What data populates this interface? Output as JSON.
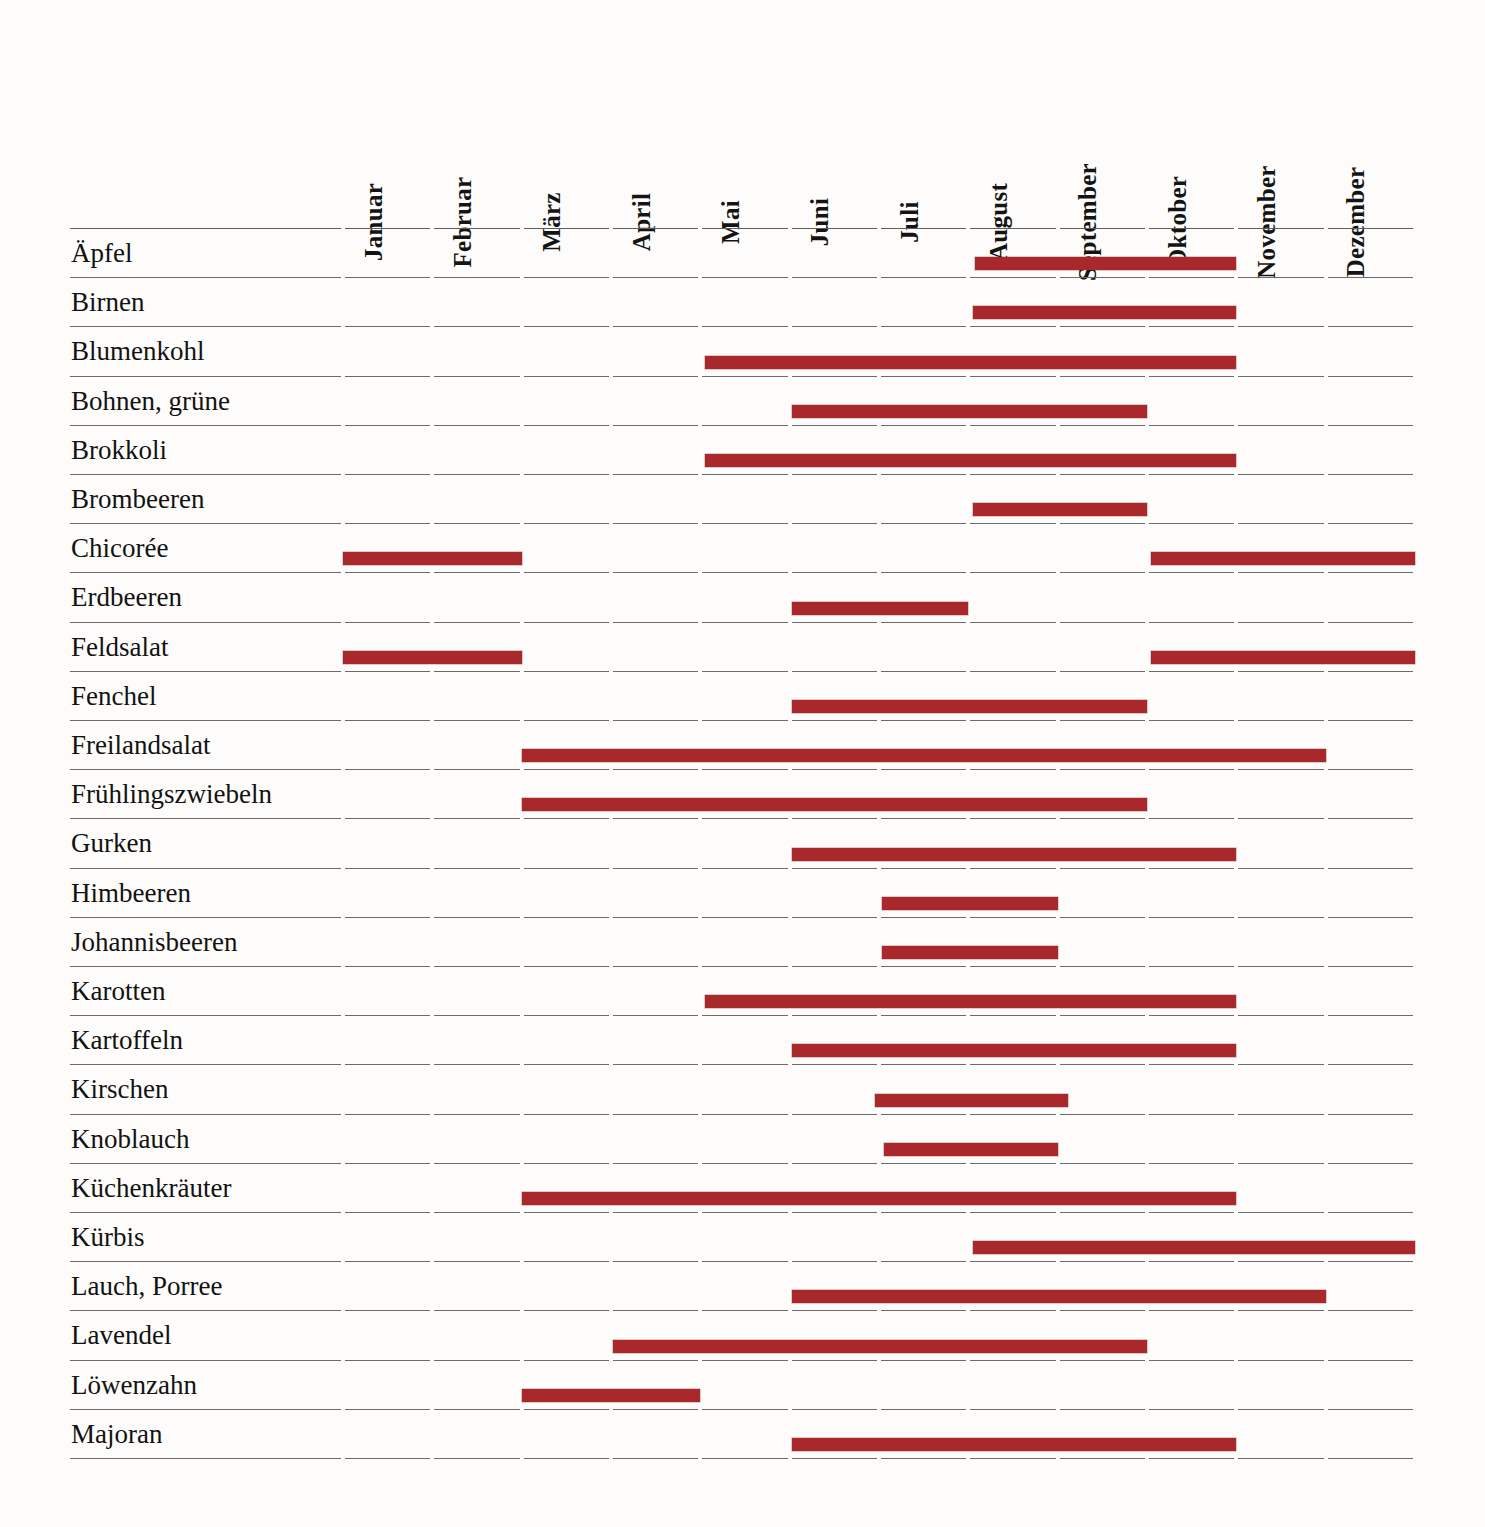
{
  "colors": {
    "bar": "#a9282c",
    "rule": "#5e5e5e",
    "background": "#fdfcfa",
    "text": "#121212"
  },
  "chart_data": {
    "type": "bar",
    "xlabel": "",
    "ylabel": "",
    "grid": true,
    "legend": null,
    "x_axis": {
      "name": "Monat",
      "position": "top",
      "orientation": "vertical-labels",
      "categories": [
        "Januar",
        "Februar",
        "März",
        "April",
        "Mai",
        "Juni",
        "Juli",
        "August",
        "September",
        "Oktober",
        "November",
        "Dezember"
      ]
    },
    "y_axis": {
      "name": "Produkt",
      "categories": [
        "Äpfel",
        "Birnen",
        "Blumenkohl",
        "Bohnen, grüne",
        "Brokkoli",
        "Brombeeren",
        "Chicorée",
        "Erdbeeren",
        "Feldsalat",
        "Fenchel",
        "Freilandsalat",
        "Frühlingszwiebeln",
        "Gurken",
        "Himbeeren",
        "Johannisbeeren",
        "Karotten",
        "Kartoffeln",
        "Kirschen",
        "Knoblauch",
        "Küchenkräuter",
        "Kürbis",
        "Lauch, Porree",
        "Lavendel",
        "Löwenzahn",
        "Majoran"
      ]
    },
    "rows": [
      {
        "label": "Äpfel",
        "spans": [
          {
            "start": 7.08,
            "end": 10.0
          }
        ]
      },
      {
        "label": "Birnen",
        "spans": [
          {
            "start": 7.05,
            "end": 10.0
          }
        ]
      },
      {
        "label": "Blumenkohl",
        "spans": [
          {
            "start": 4.05,
            "end": 10.0
          }
        ]
      },
      {
        "label": "Bohnen, grüne",
        "spans": [
          {
            "start": 5.03,
            "end": 9.0
          }
        ]
      },
      {
        "label": "Brokkoli",
        "spans": [
          {
            "start": 4.05,
            "end": 10.0
          }
        ]
      },
      {
        "label": "Brombeeren",
        "spans": [
          {
            "start": 7.05,
            "end": 9.0
          }
        ]
      },
      {
        "label": "Chicorée",
        "spans": [
          {
            "start": 0.0,
            "end": 2.0
          },
          {
            "start": 9.05,
            "end": 12.0
          }
        ]
      },
      {
        "label": "Erdbeeren",
        "spans": [
          {
            "start": 5.03,
            "end": 7.0
          }
        ]
      },
      {
        "label": "Feldsalat",
        "spans": [
          {
            "start": 0.0,
            "end": 2.0
          },
          {
            "start": 9.05,
            "end": 12.0
          }
        ]
      },
      {
        "label": "Fenchel",
        "spans": [
          {
            "start": 5.03,
            "end": 9.0
          }
        ]
      },
      {
        "label": "Freilandsalat",
        "spans": [
          {
            "start": 2.0,
            "end": 11.0
          }
        ]
      },
      {
        "label": "Frühlingszwiebeln",
        "spans": [
          {
            "start": 2.0,
            "end": 9.0
          }
        ]
      },
      {
        "label": "Gurken",
        "spans": [
          {
            "start": 5.03,
            "end": 10.0
          }
        ]
      },
      {
        "label": "Himbeeren",
        "spans": [
          {
            "start": 6.03,
            "end": 8.0
          }
        ]
      },
      {
        "label": "Johannisbeeren",
        "spans": [
          {
            "start": 6.03,
            "end": 8.0
          }
        ]
      },
      {
        "label": "Karotten",
        "spans": [
          {
            "start": 4.05,
            "end": 10.0
          }
        ]
      },
      {
        "label": "Kartoffeln",
        "spans": [
          {
            "start": 5.03,
            "end": 10.0
          }
        ]
      },
      {
        "label": "Kirschen",
        "spans": [
          {
            "start": 5.95,
            "end": 8.12
          }
        ]
      },
      {
        "label": "Knoblauch",
        "spans": [
          {
            "start": 6.06,
            "end": 8.0
          }
        ]
      },
      {
        "label": "Küchenkräuter",
        "spans": [
          {
            "start": 2.0,
            "end": 10.0
          }
        ]
      },
      {
        "label": "Kürbis",
        "spans": [
          {
            "start": 7.05,
            "end": 12.0
          }
        ]
      },
      {
        "label": "Lauch, Porree",
        "spans": [
          {
            "start": 5.03,
            "end": 11.0
          }
        ]
      },
      {
        "label": "Lavendel",
        "spans": [
          {
            "start": 3.02,
            "end": 9.0
          }
        ]
      },
      {
        "label": "Löwenzahn",
        "spans": [
          {
            "start": 2.0,
            "end": 4.0
          }
        ]
      },
      {
        "label": "Majoran",
        "spans": [
          {
            "start": 5.03,
            "end": 10.0
          }
        ]
      }
    ]
  }
}
